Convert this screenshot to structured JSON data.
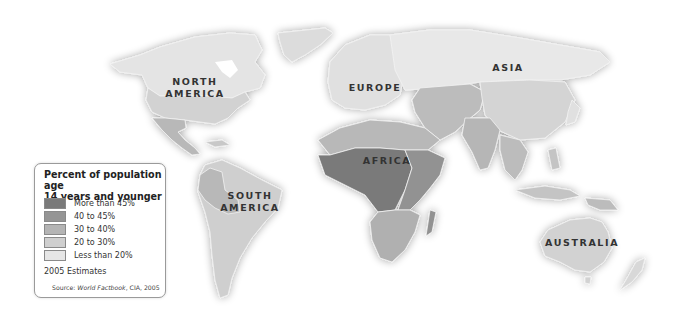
{
  "map": {
    "title": "Percent of population age 14 years and younger",
    "title_line1": "Percent of population age",
    "title_line2": "14 years and younger",
    "region_labels": {
      "north_america_1": "NORTH",
      "north_america_2": "AMERICA",
      "south_america_1": "SOUTH",
      "south_america_2": "AMERICA",
      "europe": "EUROPE",
      "asia": "ASIA",
      "africa": "AFRICA",
      "australia": "AUSTRALIA"
    },
    "legend": {
      "items": [
        {
          "label": "More than 45%",
          "color": "#7a7a7a"
        },
        {
          "label": "40 to 45%",
          "color": "#959595"
        },
        {
          "label": "30 to 40%",
          "color": "#b4b4b4"
        },
        {
          "label": "20 to 30%",
          "color": "#cfcfcf"
        },
        {
          "label": "Less than 20%",
          "color": "#e6e6e6"
        }
      ],
      "note": "2005 Estimates",
      "source_prefix": "Source: ",
      "source_title": "World Factbook",
      "source_suffix": ", CIA, 2005"
    },
    "region_classes": {
      "canada_greenland": "Less than 20%",
      "usa": "20 to 30%",
      "mexico_central_america": "30 to 40%",
      "south_america": "20 to 30%",
      "andes_bolivia_paraguay": "30 to 40%",
      "europe": "Less than 20%",
      "russia": "Less than 20%",
      "china": "20 to 30%",
      "middle_east_central_asia": "30 to 40%",
      "india_south_asia": "30 to 40%",
      "north_africa": "30 to 40%",
      "west_central_africa": "More than 45%",
      "east_africa": "40 to 45%",
      "southern_africa": "30 to 40%",
      "australia": "20 to 30%",
      "japan": "Less than 20%"
    }
  }
}
